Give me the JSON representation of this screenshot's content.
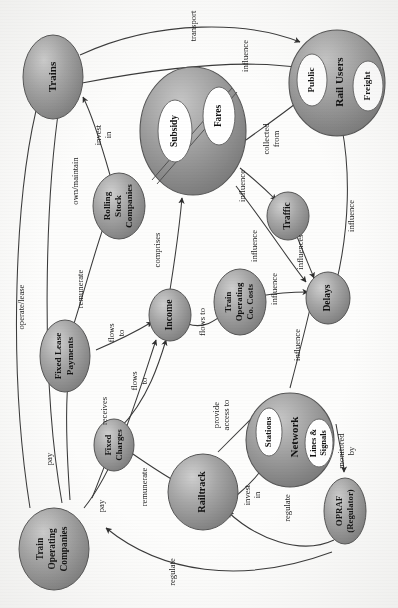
{
  "diagram": {
    "orientation_degrees": 90,
    "style": {
      "node_fill_dark": "#8e8e8e",
      "node_fill_light": "#c9c9c9",
      "node_stroke": "#4a4a4a",
      "inner_fill": "#ffffff",
      "edge_color": "#3a3a3a",
      "background": "#fdfdfc"
    },
    "nodes": [
      {
        "id": "trains",
        "label": "Trains",
        "kind": "ellipse"
      },
      {
        "id": "rolling",
        "label": "Rolling\nStock\nCompanies",
        "kind": "ellipse"
      },
      {
        "id": "income_pool",
        "label": "",
        "kind": "composite",
        "children": [
          {
            "id": "subsidy",
            "label": "Subsidy"
          },
          {
            "id": "fares",
            "label": "Fares"
          }
        ]
      },
      {
        "id": "railusers",
        "label": "Rail Users",
        "kind": "composite",
        "children": [
          {
            "id": "public",
            "label": "Public"
          },
          {
            "id": "freight",
            "label": "Freight"
          }
        ]
      },
      {
        "id": "traffic",
        "label": "Traffic",
        "kind": "ellipse"
      },
      {
        "id": "delays",
        "label": "Delays",
        "kind": "ellipse"
      },
      {
        "id": "income",
        "label": "Income",
        "kind": "ellipse"
      },
      {
        "id": "tocosts",
        "label": "Train\nOperating\nCo. Costs",
        "kind": "ellipse"
      },
      {
        "id": "fixedlease",
        "label": "Fixed Lease\nPayments",
        "kind": "ellipse"
      },
      {
        "id": "fixedcharges",
        "label": "Fixed\nCharges",
        "kind": "ellipse"
      },
      {
        "id": "network",
        "label": "Network",
        "kind": "composite",
        "children": [
          {
            "id": "stations",
            "label": "Stations"
          },
          {
            "id": "lines",
            "label": "Lines &\nSignals"
          }
        ]
      },
      {
        "id": "railtrack",
        "label": "Railtrack",
        "kind": "ellipse"
      },
      {
        "id": "opraf",
        "label": "OPRAF\n(Regulator)",
        "kind": "ellipse"
      },
      {
        "id": "toc",
        "label": "Train\nOperating\nCompanies",
        "kind": "ellipse"
      }
    ],
    "edges": [
      {
        "id": "e1",
        "from": "trains",
        "to": "railusers",
        "label": "transport"
      },
      {
        "id": "e2",
        "from": "trains",
        "to": "railusers",
        "label": "influence"
      },
      {
        "id": "e3",
        "from": "rolling",
        "to": "trains",
        "label": "invest\nin"
      },
      {
        "id": "e4",
        "from": "toc",
        "to": "trains",
        "label": "own/maintain"
      },
      {
        "id": "e5",
        "from": "toc",
        "to": "trains",
        "label": "operate/lease"
      },
      {
        "id": "e6",
        "from": "fixedlease",
        "to": "rolling",
        "label": "remunerate"
      },
      {
        "id": "e7",
        "from": "income",
        "to": "income_pool",
        "label": "comprises"
      },
      {
        "id": "e8",
        "from": "fares",
        "to": "railusers",
        "label": "collected\nfrom"
      },
      {
        "id": "e9",
        "from": "income_pool",
        "to": "traffic",
        "label": "influence"
      },
      {
        "id": "e10",
        "from": "income_pool",
        "to": "delays",
        "label": "influence"
      },
      {
        "id": "e11",
        "from": "traffic",
        "to": "delays",
        "label": "influences"
      },
      {
        "id": "e12",
        "from": "delays",
        "to": "railusers",
        "label": "influence"
      },
      {
        "id": "e13",
        "from": "tocosts",
        "to": "delays",
        "label": "influence"
      },
      {
        "id": "e14",
        "from": "network",
        "to": "delays",
        "label": "influence"
      },
      {
        "id": "e15",
        "from": "fixedlease",
        "to": "income",
        "label": "flows\nto"
      },
      {
        "id": "e16",
        "from": "income",
        "to": "tocosts",
        "label": "flows to"
      },
      {
        "id": "e17",
        "from": "fixedcharges",
        "to": "income",
        "label": "flows\nto"
      },
      {
        "id": "e18",
        "from": "toc",
        "to": "income",
        "label": "receives"
      },
      {
        "id": "e19",
        "from": "toc",
        "to": "fixedlease",
        "label": "pay"
      },
      {
        "id": "e20",
        "from": "toc",
        "to": "fixedcharges",
        "label": "pay"
      },
      {
        "id": "e21",
        "from": "fixedcharges",
        "to": "railtrack",
        "label": "remunerate"
      },
      {
        "id": "e22",
        "from": "railtrack",
        "to": "network",
        "label": "provide\naccess to"
      },
      {
        "id": "e23",
        "from": "railtrack",
        "to": "network",
        "label": "invest\nin"
      },
      {
        "id": "e24",
        "from": "opraf",
        "to": "railtrack",
        "label": "regulate"
      },
      {
        "id": "e25",
        "from": "opraf",
        "to": "toc",
        "label": "regulate"
      },
      {
        "id": "e26",
        "from": "opraf",
        "to": "network",
        "label": "monitored\nby"
      }
    ]
  }
}
